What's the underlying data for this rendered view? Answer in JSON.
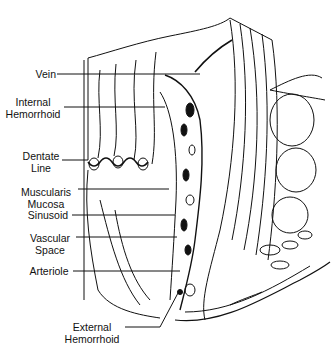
{
  "figure": {
    "colors": {
      "ink": "#111111",
      "background": "#ffffff"
    },
    "labels": [
      {
        "id": "vein",
        "lines": [
          "Vein"
        ],
        "text": "Vein"
      },
      {
        "id": "internal-hemorrhoid",
        "lines": [
          "Internal",
          "Hemorrhoid"
        ],
        "text": "Internal Hemorrhoid"
      },
      {
        "id": "dentate-line",
        "lines": [
          "Dentate",
          "Line"
        ],
        "text": "Dentate Line"
      },
      {
        "id": "muscularis-mucosa",
        "lines": [
          "Muscularis",
          "Mucosa"
        ],
        "text": "Muscularis Mucosa"
      },
      {
        "id": "sinusoid",
        "lines": [
          "Sinusoid"
        ],
        "text": "Sinusoid"
      },
      {
        "id": "vascular-space",
        "lines": [
          "Vascular",
          "Space"
        ],
        "text": "Vascular Space"
      },
      {
        "id": "arteriole",
        "lines": [
          "Arteriole"
        ],
        "text": "Arteriole"
      },
      {
        "id": "external-hemorrhoid",
        "lines": [
          "External",
          "Hemorrhoid"
        ],
        "text": "External Hemorrhoid"
      }
    ]
  }
}
